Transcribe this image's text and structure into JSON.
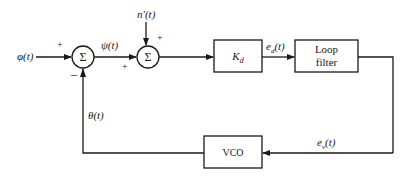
{
  "diagram": {
    "type": "block-diagram",
    "colors": {
      "line": "#1a1a1a",
      "background": "#ffffff"
    },
    "inputs": {
      "phi": "φ(t)",
      "noise": "n′(t)"
    },
    "summers": [
      {
        "id": "sum1",
        "symbol": "Σ",
        "signs": {
          "left": "+",
          "bottom": "−"
        }
      },
      {
        "id": "sum2",
        "symbol": "Σ",
        "signs": {
          "top": "+",
          "left": "+"
        }
      }
    ],
    "blocks": {
      "kd": {
        "label_main": "K",
        "label_sub": "d"
      },
      "loop_filter": {
        "line1": "Loop",
        "line2": "filter"
      },
      "vco": {
        "label": "VCO"
      }
    },
    "signals": {
      "psi": "ψ(t)",
      "ed": "e",
      "ed_sub": "d",
      "ed_suffix": "(t)",
      "ev": "e",
      "ev_sub": "v",
      "ev_suffix": "(t)",
      "theta": "θ(t)"
    }
  }
}
